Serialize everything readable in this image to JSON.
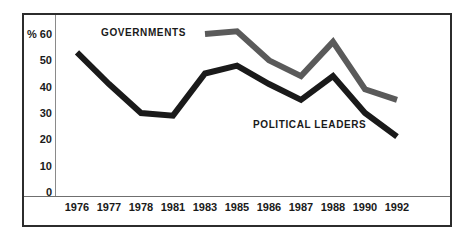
{
  "chart_data": {
    "type": "line",
    "title": "",
    "xlabel": "",
    "ylabel": "%",
    "ylim": [
      0,
      60
    ],
    "grid": false,
    "legend_position": "inline-annotations",
    "categories": [
      "1976",
      "1977",
      "1978",
      "1981",
      "1983",
      "1985",
      "1986",
      "1987",
      "1988",
      "1990",
      "1992"
    ],
    "yticks": [
      "% 60",
      "50",
      "40",
      "30",
      "20",
      "10",
      "0"
    ],
    "ytick_values": [
      60,
      50,
      40,
      30,
      20,
      10,
      0
    ],
    "series": [
      {
        "name": "GOVERNMENTS",
        "color": "#5a5a5a",
        "x": [
          "1983",
          "1985",
          "1986",
          "1987",
          "1988",
          "1990",
          "1992"
        ],
        "values": [
          60,
          61,
          50,
          44,
          57,
          39,
          35
        ]
      },
      {
        "name": "POLITICAL LEADERS",
        "color": "#1a1a1a",
        "x": [
          "1976",
          "1977",
          "1978",
          "1981",
          "1983",
          "1985",
          "1986",
          "1987",
          "1988",
          "1990",
          "1992"
        ],
        "values": [
          53,
          41,
          30,
          29,
          45,
          48,
          41,
          35,
          44,
          30,
          21
        ]
      }
    ],
    "annotations": [
      {
        "text": "GOVERNMENTS",
        "series": "GOVERNMENTS"
      },
      {
        "text": "POLITICAL LEADERS",
        "series": "POLITICAL LEADERS"
      }
    ]
  },
  "colors": {
    "governments_line": "#5a5a5a",
    "political_leaders_line": "#1a1a1a",
    "frame": "#2c2c2c",
    "axis_rule": "#8a8a8a",
    "background": "#ffffff",
    "text": "#1a1a1a"
  }
}
